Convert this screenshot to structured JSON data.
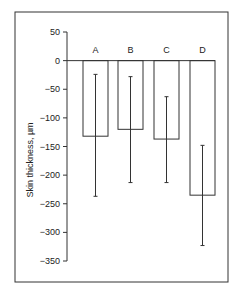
{
  "chart_data": {
    "type": "bar",
    "title": "",
    "xlabel": "",
    "ylabel": "Skin thickness, µm",
    "ylim": [
      -350,
      50
    ],
    "yticks": [
      50,
      0,
      -50,
      -100,
      -150,
      -200,
      -250,
      -300,
      -350
    ],
    "ytick_labels": [
      "50",
      "0",
      "−50",
      "−100",
      "−150",
      "−200",
      "−250",
      "−300",
      "−350"
    ],
    "categories": [
      "A",
      "B",
      "C",
      "D"
    ],
    "values": [
      -132,
      -120,
      -137,
      -235
    ],
    "error_low": [
      -237,
      -213,
      -213,
      -323
    ],
    "error_high": [
      -24,
      -28,
      -63,
      -148
    ],
    "grid": false,
    "legend": "none",
    "category_labels_position": "above zero line"
  }
}
